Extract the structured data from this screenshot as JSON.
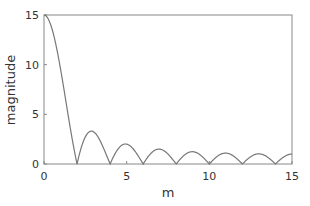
{
  "chart_data": {
    "type": "line",
    "title": "",
    "xlabel": "m",
    "ylabel": "magnitude",
    "xlim": [
      0,
      15
    ],
    "ylim": [
      0,
      15
    ],
    "xticks": [
      0,
      5,
      10,
      15
    ],
    "yticks": [
      0,
      5,
      10,
      15
    ],
    "grid": false,
    "legend": null,
    "function": "|sin(pi*m/2) / sin(pi*m/30)|",
    "series": [
      {
        "name": "magnitude",
        "color": "#777777",
        "x": [
          0,
          0.5,
          1,
          1.5,
          2,
          2.5,
          3,
          3.5,
          4,
          4.5,
          5,
          5.5,
          6,
          6.5,
          7,
          7.5,
          8,
          8.5,
          9,
          9.5,
          10,
          10.5,
          11,
          11.5,
          12,
          12.5,
          13,
          13.5,
          14,
          14.5,
          15
        ],
        "values": [
          15,
          13.5,
          9.6,
          4.6,
          0,
          2.4,
          3.24,
          2.3,
          0,
          1.6,
          2.0,
          1.4,
          0,
          1.2,
          1.51,
          1.1,
          0,
          0.96,
          1.24,
          0.9,
          0,
          0.85,
          1.1,
          0.79,
          0,
          0.75,
          1.02,
          0.73,
          0,
          0.71,
          1.0
        ]
      }
    ]
  },
  "axes": {
    "x_tick_labels": [
      "0",
      "5",
      "10",
      "15"
    ],
    "y_tick_labels": [
      "0",
      "5",
      "10",
      "15"
    ],
    "xlabel": "m",
    "ylabel": "magnitude"
  }
}
